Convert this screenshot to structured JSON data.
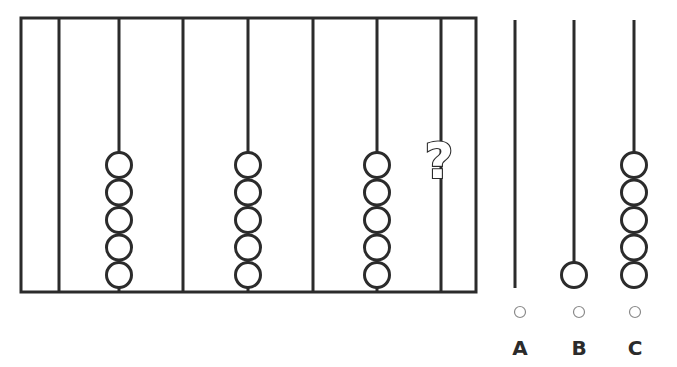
{
  "puzzle": {
    "frame": {
      "x": 21,
      "y": 18,
      "width": 455,
      "height": 274
    },
    "rods": [
      {
        "x": 59,
        "beads": 0
      },
      {
        "x": 119,
        "beads": 5
      },
      {
        "x": 183,
        "beads": 0
      },
      {
        "x": 248,
        "beads": 5
      },
      {
        "x": 313,
        "beads": 0
      },
      {
        "x": 377,
        "beads": 5
      },
      {
        "x": 441,
        "beads": null,
        "unknown": true
      }
    ],
    "missing_marker": "?",
    "bead_radius": 12.5,
    "bead_spacing": 27.5,
    "bead_bottom_center_y": 275,
    "colors": {
      "stroke": "#2b2b2b",
      "radio": "#8a8a8a",
      "background": "#ffffff"
    }
  },
  "options": [
    {
      "label": "A",
      "rod_x": 515,
      "beads": 0,
      "radio_x": 520
    },
    {
      "label": "B",
      "rod_x": 574,
      "beads": 1,
      "radio_x": 579
    },
    {
      "label": "C",
      "rod_x": 634,
      "beads": 5,
      "radio_x": 635
    }
  ],
  "option_layout": {
    "rod_top": 20,
    "rod_bottom": 288,
    "radio_y": 312,
    "radio_r": 5.5,
    "label_y": 355
  }
}
